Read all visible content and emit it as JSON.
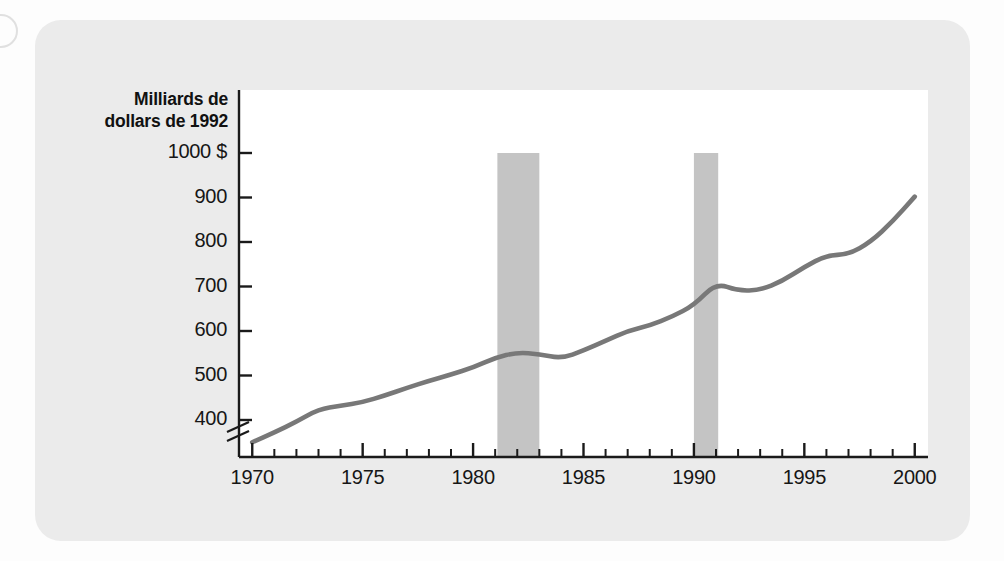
{
  "figure": {
    "panel_color": "#ebebeb",
    "plot_background": "#ffffff",
    "line_color": "#787878",
    "band_color": "#c4c4c4",
    "axis_color": "#1a1a1a",
    "edge_mark_name": "page-edge-circle"
  },
  "chart_data": {
    "type": "line",
    "title": "",
    "subtitle": "",
    "xlabel": "",
    "ylabel": "Milliards de dollars de 1992",
    "ylabel_lines": [
      "Milliards de",
      "dollars de 1992"
    ],
    "currency_suffix": "$",
    "grid": false,
    "legend": "none",
    "axis_break": true,
    "xlim": [
      1969.4,
      2000.6
    ],
    "ylim": [
      330,
      1000
    ],
    "xticks_major": [
      1970,
      1975,
      1980,
      1985,
      1990,
      1995,
      2000
    ],
    "xtick_labels": [
      "1970",
      "1975",
      "1980",
      "1985",
      "1990",
      "1995",
      "2000"
    ],
    "xticks_minor": [
      1971,
      1972,
      1973,
      1974,
      1976,
      1977,
      1978,
      1979,
      1981,
      1982,
      1983,
      1984,
      1986,
      1987,
      1988,
      1989,
      1991,
      1992,
      1993,
      1994,
      1996,
      1997,
      1998,
      1999
    ],
    "yticks": [
      400,
      500,
      600,
      700,
      800,
      900,
      1000
    ],
    "ytick_labels": [
      "400",
      "500",
      "600",
      "700",
      "800",
      "900",
      "1000 $"
    ],
    "shaded_regions": [
      {
        "name": "recession-band-1981-1982",
        "x0": 1981.1,
        "x1": 1983.0
      },
      {
        "name": "recession-band-1990-1991",
        "x0": 1990.0,
        "x1": 1991.1
      }
    ],
    "series": [
      {
        "name": "Dépenses",
        "x": [
          1970,
          1971,
          1972,
          1973,
          1974,
          1975,
          1976,
          1977,
          1978,
          1979,
          1980,
          1981,
          1982,
          1983,
          1984,
          1985,
          1986,
          1987,
          1988,
          1989,
          1990,
          1991,
          1992,
          1993,
          1994,
          1995,
          1996,
          1997,
          1998,
          1999,
          2000
        ],
        "values": [
          350,
          370,
          392,
          416,
          430,
          436,
          448,
          463,
          478,
          492,
          508,
          524,
          540,
          546,
          544,
          538,
          552,
          572,
          590,
          603,
          618,
          632,
          648,
          668,
          688,
          705,
          712,
          694,
          690,
          696,
          706
        ],
        "values_note": "line continues: 1995 plateau then steady rise to 2000"
      }
    ],
    "series_full": {
      "name": "Dépenses réelles",
      "points": [
        {
          "year": 1970,
          "value": 350
        },
        {
          "year": 1971,
          "value": 372
        },
        {
          "year": 1972,
          "value": 396
        },
        {
          "year": 1973,
          "value": 424
        },
        {
          "year": 1974,
          "value": 432
        },
        {
          "year": 1975,
          "value": 440
        },
        {
          "year": 1976,
          "value": 455
        },
        {
          "year": 1977,
          "value": 472
        },
        {
          "year": 1978,
          "value": 488
        },
        {
          "year": 1979,
          "value": 502
        },
        {
          "year": 1980,
          "value": 518
        },
        {
          "year": 1981,
          "value": 540
        },
        {
          "year": 1982,
          "value": 552
        },
        {
          "year": 1983,
          "value": 548
        },
        {
          "year": 1984,
          "value": 538
        },
        {
          "year": 1985,
          "value": 556
        },
        {
          "year": 1986,
          "value": 578
        },
        {
          "year": 1987,
          "value": 600
        },
        {
          "year": 1988,
          "value": 612
        },
        {
          "year": 1989,
          "value": 632
        },
        {
          "year": 1990,
          "value": 658
        },
        {
          "year": 1991,
          "value": 708
        },
        {
          "year": 1992,
          "value": 690
        },
        {
          "year": 1993,
          "value": 692
        },
        {
          "year": 1994,
          "value": 712
        },
        {
          "year": 1995,
          "value": 744
        },
        {
          "year": 1996,
          "value": 770
        },
        {
          "year": 1997,
          "value": 772
        },
        {
          "year": 1998,
          "value": 800
        },
        {
          "year": 1999,
          "value": 846
        },
        {
          "year": 2000,
          "value": 902
        }
      ]
    }
  }
}
